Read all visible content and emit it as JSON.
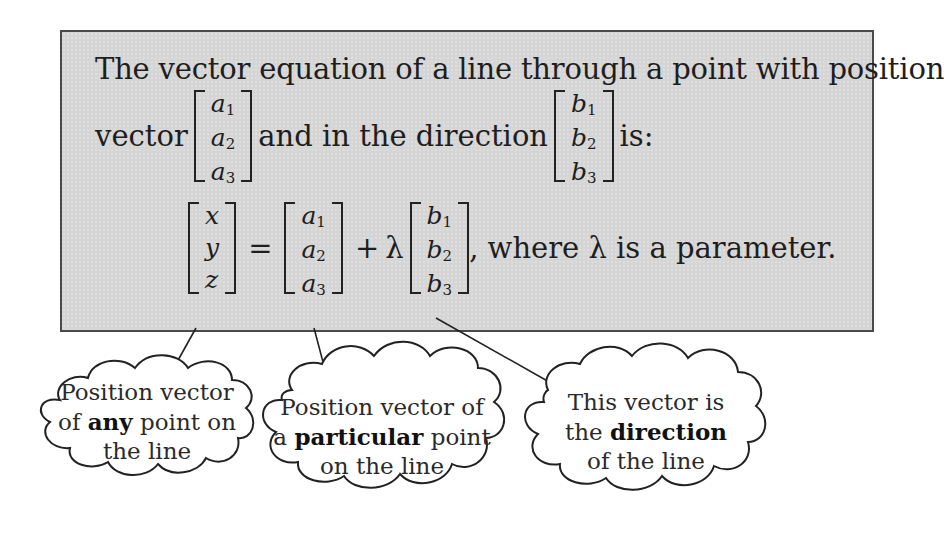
{
  "panel": {
    "line1": "The vector equation of a line through a point with position",
    "line2_prefix": "vector",
    "line2_middle": "and in the direction",
    "line2_suffix": "is:",
    "position_vector": [
      "a",
      "a",
      "a"
    ],
    "position_subscripts": [
      "1",
      "2",
      "3"
    ],
    "direction_vector": [
      "b",
      "b",
      "b"
    ],
    "direction_subscripts": [
      "1",
      "2",
      "3"
    ]
  },
  "equation": {
    "lhs": [
      "x",
      "y",
      "z"
    ],
    "equals": "=",
    "point": [
      "a",
      "a",
      "a"
    ],
    "point_subscripts": [
      "1",
      "2",
      "3"
    ],
    "plus": "+",
    "lambda": "λ",
    "direction": [
      "b",
      "b",
      "b"
    ],
    "direction_subscripts": [
      "1",
      "2",
      "3"
    ],
    "suffix": ", where λ is a parameter."
  },
  "callouts": [
    {
      "pre": "Position vector of ",
      "bold": "any",
      "post": " point on the line",
      "lines": [
        [
          "Position vector"
        ],
        [
          "of ",
          "any",
          " point on"
        ],
        [
          "the line"
        ]
      ]
    },
    {
      "pre": "Position vector of a ",
      "bold": "particular",
      "post": " point on the line",
      "lines": [
        [
          "Position vector of"
        ],
        [
          "a ",
          "particular",
          " point"
        ],
        [
          "on the line"
        ]
      ]
    },
    {
      "pre": "This vector is the ",
      "bold": "direction",
      "post": " of the line",
      "lines": [
        [
          "This vector is"
        ],
        [
          "the ",
          "direction"
        ],
        [
          "of the line"
        ]
      ]
    }
  ],
  "colors": {
    "panel_bg": "#d5d5d5",
    "panel_border": "#4a4a4a",
    "ink": "#1e1e1e"
  }
}
